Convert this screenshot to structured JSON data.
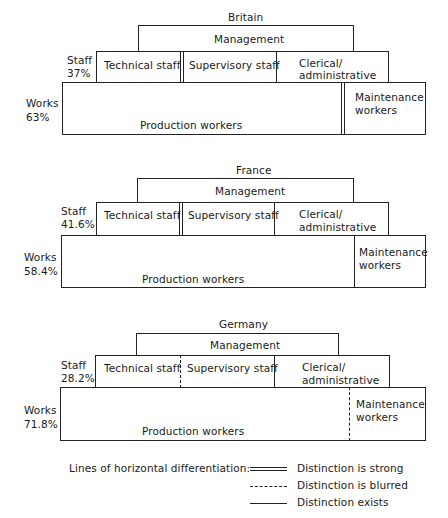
{
  "panels": [
    {
      "country": "Britain",
      "management_label": "Management",
      "staff_label": "Staff",
      "staff_pct": "37%",
      "works_label": "Works",
      "works_pct": "63%",
      "staff_boxes": [
        "Technical staff",
        "Supervisory staff",
        "Clerical/",
        "administrative"
      ],
      "works_boxes": [
        "Production workers",
        "Maintenance",
        "workers"
      ],
      "tech_supervisory_line": "strong",
      "supervisory_clerical_line": "exists",
      "production_maintenance_line": "strong"
    },
    {
      "country": "France",
      "management_label": "Management",
      "staff_label": "Staff",
      "staff_pct": "41.6%",
      "works_label": "Works",
      "works_pct": "58.4%",
      "staff_boxes": [
        "Technical staff",
        "Supervisory staff",
        "Clerical/",
        "administrative"
      ],
      "works_boxes": [
        "Production workers",
        "Maintenance",
        "workers"
      ],
      "tech_supervisory_line": "strong",
      "supervisory_clerical_line": "exists",
      "production_maintenance_line": "exists"
    },
    {
      "country": "Germany",
      "management_label": "Management",
      "staff_label": "Staff",
      "staff_pct": "28.2%",
      "works_label": "Works",
      "works_pct": "71.8%",
      "staff_boxes": [
        "Technical staff",
        "Supervisory staff",
        "Clerical/",
        "administrative"
      ],
      "works_boxes": [
        "Production workers",
        "Maintenance",
        "workers"
      ],
      "tech_supervisory_line": "blurred",
      "supervisory_clerical_line": "exists",
      "production_maintenance_line": "blurred"
    }
  ],
  "legend": {
    "title": "Lines of horizontal differentiation:",
    "items": [
      {
        "style": "strong",
        "label": "Distinction is strong"
      },
      {
        "style": "blurred",
        "label": "Distinction is blurred"
      },
      {
        "style": "exists",
        "label": "Distinction exists"
      }
    ]
  }
}
